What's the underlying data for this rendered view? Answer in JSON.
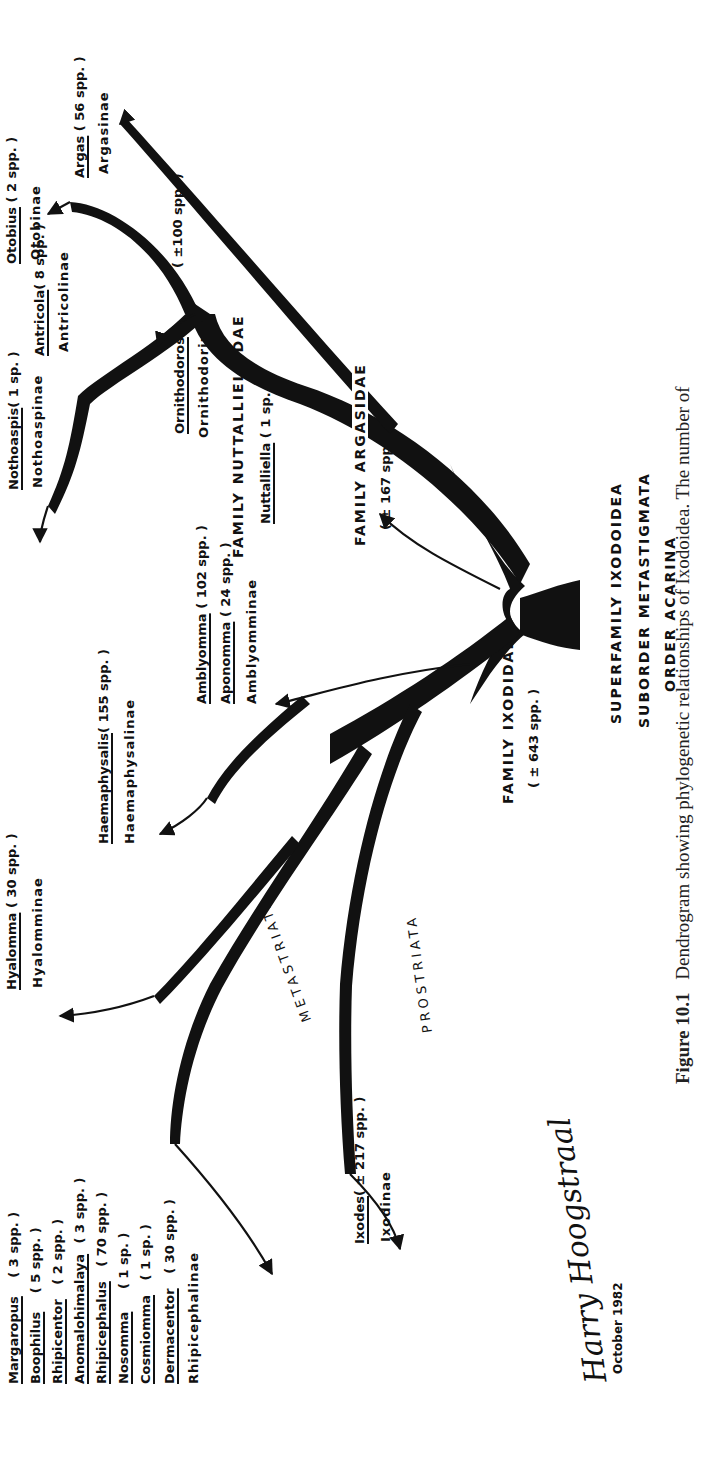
{
  "figure": {
    "label": "Figure 10.1",
    "caption": "Dendrogram showing phylogenetic relationships of Ixodoidea. The number of",
    "signature": "Harry Hoogstraal",
    "date": "October 1982"
  },
  "hierarchy": {
    "superfamily": "SUPERFAMILY   IXODOIDEA",
    "suborder": "SUBORDER   METASTIGMATA",
    "order": "ORDER   ACARINA"
  },
  "families": {
    "argasidae": {
      "name": "FAMILY  ARGASIDAE",
      "count": "( ± 167 spp. )"
    },
    "nuttalliellidae": {
      "name": "FAMILY  NUTTALLIELLIDAE",
      "genus": "Nuttalliella",
      "count": " ( 1 sp. )"
    },
    "ixodidae": {
      "name": "FAMILY  IXODIDAE",
      "count": "( ± 643 spp. )"
    }
  },
  "branches": {
    "metastriata": "METASTRIATA",
    "prostriata": "PROSTRIATA"
  },
  "argasid_genera": [
    {
      "genus": "Argas",
      "count": "( 56 spp. )",
      "subfamily": "Argasinae"
    },
    {
      "genus": "Otobius",
      "count": "( 2 spp. )",
      "subfamily": "Otobinae"
    },
    {
      "genus": "Antricola",
      "count": "( 8 spp. )",
      "subfamily": "Antricolinae"
    },
    {
      "genus": "Ornithodoros",
      "count": "( ±100 spp. )",
      "subfamily": "Ornithodorinae"
    },
    {
      "genus": "Nothoaspis",
      "count": "( 1 sp. )",
      "subfamily": "Nothoaspinae"
    }
  ],
  "ixodid_groups": {
    "amblyomminae": {
      "genera": [
        {
          "genus": "Amblyomma",
          "count": "( 102 spp. )"
        },
        {
          "genus": "Aponomma",
          "count": "( 24 spp. )"
        }
      ],
      "subfamily": "Amblyomminae"
    },
    "haemaphysalinae": {
      "genus": "Haemaphysalis",
      "count": "( 155 spp. )",
      "subfamily": "Haemaphysalinae"
    },
    "hyalomminae": {
      "genus": "Hyalomma",
      "count": "( 30 spp. )",
      "subfamily": "Hyalomminae"
    },
    "ixodinae": {
      "genus": "Ixodes",
      "count": "( ± 217 spp. )",
      "subfamily": "Ixodinae"
    },
    "rhipicephalinae": {
      "genera": [
        {
          "genus": "Margaropus",
          "count": "( 3 spp. )"
        },
        {
          "genus": "Boophilus",
          "count": "( 5 spp. )"
        },
        {
          "genus": "Rhipicentor",
          "count": "( 2 spp. )"
        },
        {
          "genus": "Anomalohimalaya",
          "count": "( 3 spp. )"
        },
        {
          "genus": "Rhipicephalus",
          "count": "( 70 spp. )"
        },
        {
          "genus": "Nosomma",
          "count": "( 1 sp. )"
        },
        {
          "genus": "Cosmiomma",
          "count": "( 1 sp. )"
        },
        {
          "genus": "Dermacentor",
          "count": "( 30 spp. )"
        }
      ],
      "subfamily": "Rhipicephalinae"
    }
  },
  "colors": {
    "ink": "#111111",
    "paper": "#ffffff"
  }
}
